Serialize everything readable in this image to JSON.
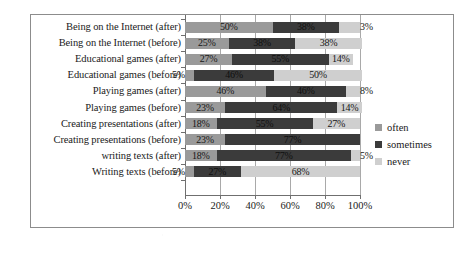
{
  "chart_data": {
    "type": "bar",
    "orientation": "horizontal",
    "stacked": true,
    "stack_mode": "percent",
    "title": "",
    "subtitle": "",
    "xlabel": "",
    "ylabel": "",
    "xlim": [
      0,
      100
    ],
    "grid": true,
    "legend_position": "right",
    "xticks": [
      "0%",
      "20%",
      "40%",
      "60%",
      "80%",
      "100%"
    ],
    "xtick_values": [
      0,
      20,
      40,
      60,
      80,
      100
    ],
    "categories": [
      "Being on the Internet (after)",
      "Being on the Internet (before)",
      "Educational games (after)",
      "Educational games (before)",
      "Playing games (after)",
      "Playing games (before)",
      "Creating presentations (after)",
      "Creating presentations (before)",
      "writing texts (after)",
      "Writing texts (before)"
    ],
    "series": [
      {
        "name": "often",
        "color": "#9a9a9a",
        "values": [
          50,
          25,
          27,
          5,
          46,
          23,
          18,
          23,
          18,
          5
        ],
        "labels": [
          "50%",
          "25%",
          "27%",
          "5%",
          "46%",
          "23%",
          "18%",
          "23%",
          "18%",
          "5%"
        ]
      },
      {
        "name": "sometimes",
        "color": "#3b3b3b",
        "values": [
          38,
          38,
          55,
          46,
          46,
          64,
          55,
          77,
          77,
          27
        ],
        "labels": [
          "38%",
          "38%",
          "55%",
          "46%",
          "46%",
          "64%",
          "55%",
          "77%",
          "77%",
          "27%"
        ]
      },
      {
        "name": "never",
        "color": "#cfcfcf",
        "values": [
          12,
          38,
          14,
          50,
          8,
          14,
          27,
          0,
          5,
          68
        ],
        "labels": [
          "3%",
          "38%",
          "14%",
          "50%",
          "8%",
          "14%",
          "27%",
          "",
          "5%",
          "68%"
        ]
      }
    ]
  },
  "legend": {
    "items": [
      {
        "label": "often"
      },
      {
        "label": "sometimes"
      },
      {
        "label": "never"
      }
    ]
  }
}
